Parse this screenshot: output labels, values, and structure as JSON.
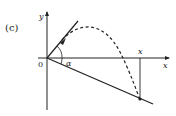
{
  "figure": {
    "panel_label": "(c)",
    "axes": {
      "x_label": "x",
      "y_label": "y",
      "origin_label": "0"
    },
    "angle_label": "α",
    "range_label": "x",
    "colors": {
      "stroke": "#222222",
      "background": "#ffffff"
    },
    "elements": [
      "launch-velocity-line",
      "inclined-plane-line",
      "dashed-trajectory",
      "vertical-drop-line",
      "angle-arc"
    ]
  }
}
